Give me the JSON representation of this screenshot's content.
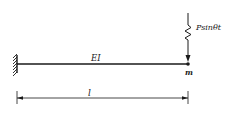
{
  "diagram": {
    "type": "cantilever-beam",
    "colors": {
      "stroke": "#1a1a1a",
      "background": "#ffffff"
    },
    "beam": {
      "label": "EI"
    },
    "support": {
      "kind": "fixed-wall"
    },
    "mass": {
      "label": "m"
    },
    "load": {
      "label": "Psinθt",
      "kind": "harmonic-force-with-spring"
    },
    "dimension": {
      "label": "l"
    }
  }
}
